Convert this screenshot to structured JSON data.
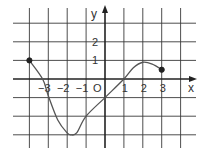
{
  "chart_data": {
    "type": "line",
    "title": "",
    "xlabel": "x",
    "ylabel": "y",
    "origin_label": "O",
    "xlim": [
      -4,
      4
    ],
    "ylim": [
      -3,
      3
    ],
    "grid": true,
    "x_ticks": [
      {
        "value": -3,
        "label": "−3"
      },
      {
        "value": -2,
        "label": "−2"
      },
      {
        "value": -1,
        "label": "−1"
      },
      {
        "value": 1,
        "label": "1"
      },
      {
        "value": 2,
        "label": "2"
      },
      {
        "value": 3,
        "label": "3"
      }
    ],
    "y_ticks": [
      {
        "value": 1,
        "label": "1"
      },
      {
        "value": 2,
        "label": "2"
      }
    ],
    "series": [
      {
        "name": "f(x)",
        "x": [
          -4,
          -3.3,
          -3,
          -2.5,
          -2,
          -1.8,
          -1.5,
          -1,
          0,
          1,
          1.5,
          2,
          2.5,
          3
        ],
        "y": [
          1,
          0,
          -0.9,
          -2.2,
          -2.9,
          -3,
          -2.9,
          -2,
          -1,
          0,
          0.6,
          0.9,
          0.8,
          0.5
        ]
      }
    ],
    "endpoints": [
      {
        "x": -4,
        "y": 1,
        "filled": true
      },
      {
        "x": 3,
        "y": 0.5,
        "filled": true
      }
    ],
    "colors": {
      "grid": "#3a3a3a",
      "curve": "#555555",
      "axis": "#222222"
    }
  }
}
